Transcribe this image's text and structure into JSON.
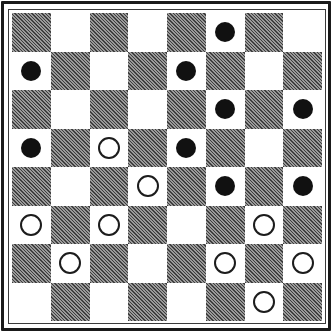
{
  "board": {
    "size": 8,
    "colors": {
      "light": "#ffffff",
      "dark": "#7a7a7a",
      "black_piece": "#111111",
      "white_piece_stroke": "#1c1c1c"
    },
    "rows": [
      [
        "",
        "",
        "",
        "",
        "",
        "B",
        "",
        ""
      ],
      [
        "B",
        "",
        "",
        "",
        "B",
        "",
        "",
        ""
      ],
      [
        "",
        "",
        "",
        "",
        "",
        "B",
        "",
        "B"
      ],
      [
        "B",
        "",
        "W",
        "",
        "B",
        "",
        "",
        ""
      ],
      [
        "",
        "",
        "",
        "W",
        "",
        "B",
        "",
        "B"
      ],
      [
        "W",
        "",
        "W",
        "",
        "",
        "",
        "W",
        ""
      ],
      [
        "",
        "W",
        "",
        "",
        "",
        "W",
        "",
        "W"
      ],
      [
        "",
        "",
        "",
        "",
        "",
        "",
        "W",
        ""
      ]
    ],
    "pieces": {
      "black": [
        {
          "row": 0,
          "col": 5
        },
        {
          "row": 1,
          "col": 0
        },
        {
          "row": 1,
          "col": 4
        },
        {
          "row": 2,
          "col": 5
        },
        {
          "row": 2,
          "col": 7
        },
        {
          "row": 3,
          "col": 0
        },
        {
          "row": 3,
          "col": 4
        },
        {
          "row": 4,
          "col": 5
        },
        {
          "row": 4,
          "col": 7
        }
      ],
      "white": [
        {
          "row": 3,
          "col": 2
        },
        {
          "row": 4,
          "col": 3
        },
        {
          "row": 5,
          "col": 0
        },
        {
          "row": 5,
          "col": 2
        },
        {
          "row": 5,
          "col": 6
        },
        {
          "row": 6,
          "col": 1
        },
        {
          "row": 6,
          "col": 5
        },
        {
          "row": 6,
          "col": 7
        },
        {
          "row": 7,
          "col": 6
        }
      ]
    },
    "counts": {
      "black": 9,
      "white": 9
    }
  }
}
